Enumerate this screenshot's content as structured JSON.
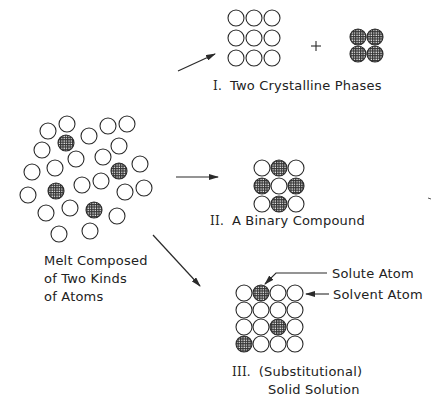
{
  "melt": {
    "label_lines": [
      "Melt Composed",
      "of Two Kinds",
      "of Atoms"
    ],
    "atoms": [
      {
        "x": 67,
        "y": 124,
        "solute": false
      },
      {
        "x": 48,
        "y": 131,
        "solute": false
      },
      {
        "x": 108,
        "y": 126,
        "solute": false
      },
      {
        "x": 127,
        "y": 124,
        "solute": false
      },
      {
        "x": 66,
        "y": 143,
        "solute": true
      },
      {
        "x": 89,
        "y": 136,
        "solute": false
      },
      {
        "x": 42,
        "y": 150,
        "solute": false
      },
      {
        "x": 119,
        "y": 146,
        "solute": false
      },
      {
        "x": 76,
        "y": 159,
        "solute": false
      },
      {
        "x": 103,
        "y": 157,
        "solute": false
      },
      {
        "x": 32,
        "y": 172,
        "solute": false
      },
      {
        "x": 55,
        "y": 168,
        "solute": false
      },
      {
        "x": 119,
        "y": 171,
        "solute": true
      },
      {
        "x": 140,
        "y": 164,
        "solute": false
      },
      {
        "x": 56,
        "y": 191,
        "solute": true
      },
      {
        "x": 82,
        "y": 185,
        "solute": false
      },
      {
        "x": 101,
        "y": 181,
        "solute": false
      },
      {
        "x": 28,
        "y": 195,
        "solute": false
      },
      {
        "x": 125,
        "y": 192,
        "solute": false
      },
      {
        "x": 144,
        "y": 188,
        "solute": false
      },
      {
        "x": 94,
        "y": 210,
        "solute": true
      },
      {
        "x": 46,
        "y": 213,
        "solute": false
      },
      {
        "x": 70,
        "y": 208,
        "solute": false
      },
      {
        "x": 117,
        "y": 216,
        "solute": false
      },
      {
        "x": 90,
        "y": 231,
        "solute": false
      },
      {
        "x": 59,
        "y": 234,
        "solute": false
      }
    ]
  },
  "products": [
    {
      "numeral": "I.",
      "title": "Two Crystalline Phases",
      "operator": "+"
    },
    {
      "numeral": "II.",
      "title": "A Binary Compound"
    },
    {
      "numeral": "III.",
      "title_lines": [
        "(Substitutional)",
        "Solid Solution"
      ],
      "callouts": {
        "solute": "Solute Atom",
        "solvent": "Solvent Atom"
      }
    }
  ],
  "colors": {
    "line": "#2a2a2a",
    "hatch": "#3a3a3a",
    "background": "#ffffff"
  }
}
